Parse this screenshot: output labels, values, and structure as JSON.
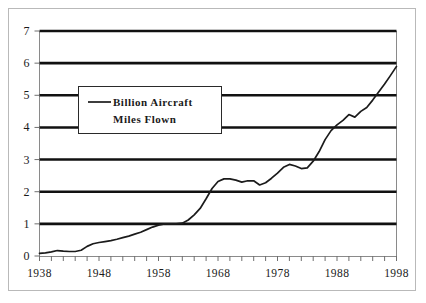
{
  "chart_data": {
    "type": "line",
    "title": "",
    "xlabel": "",
    "ylabel": "",
    "xlim": [
      1938,
      1998
    ],
    "ylim": [
      0,
      7
    ],
    "grid": true,
    "legend_position": "upper-left-inside",
    "y_ticks": [
      "0",
      "1",
      "2",
      "3",
      "4",
      "5",
      "6",
      "7"
    ],
    "x_ticks": [
      "1938",
      "1948",
      "1958",
      "1968",
      "1978",
      "1988",
      "1998"
    ],
    "x_minor_tick_interval": 2,
    "series": [
      {
        "name": "Billion Aircraft Miles Flown",
        "legend_label_line1": "Billion Aircraft",
        "legend_label_line2": "Miles Flown",
        "color": "#1b1b1b",
        "x": [
          1938,
          1939,
          1940,
          1941,
          1942,
          1943,
          1944,
          1945,
          1946,
          1947,
          1948,
          1949,
          1950,
          1951,
          1952,
          1953,
          1954,
          1955,
          1956,
          1957,
          1958,
          1959,
          1960,
          1961,
          1962,
          1963,
          1964,
          1965,
          1966,
          1967,
          1968,
          1969,
          1970,
          1971,
          1972,
          1973,
          1974,
          1975,
          1976,
          1977,
          1978,
          1979,
          1980,
          1981,
          1982,
          1983,
          1984,
          1985,
          1986,
          1987,
          1988,
          1989,
          1990,
          1991,
          1992,
          1993,
          1994,
          1995,
          1996,
          1997,
          1998
        ],
        "values": [
          0.08,
          0.1,
          0.13,
          0.17,
          0.15,
          0.14,
          0.14,
          0.18,
          0.3,
          0.38,
          0.42,
          0.45,
          0.48,
          0.52,
          0.57,
          0.62,
          0.68,
          0.74,
          0.82,
          0.9,
          0.96,
          1.0,
          1.0,
          1.0,
          1.02,
          1.12,
          1.28,
          1.48,
          1.78,
          2.1,
          2.32,
          2.4,
          2.4,
          2.36,
          2.3,
          2.34,
          2.34,
          2.21,
          2.28,
          2.42,
          2.58,
          2.76,
          2.85,
          2.8,
          2.72,
          2.74,
          2.95,
          3.25,
          3.62,
          3.9,
          4.08,
          4.22,
          4.4,
          4.32,
          4.5,
          4.62,
          4.85,
          5.1,
          5.35,
          5.62,
          5.9
        ]
      }
    ]
  }
}
